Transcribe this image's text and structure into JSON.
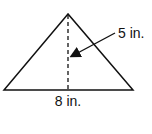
{
  "diagram": {
    "shape": "triangle",
    "height_label": "5 in.",
    "base_label": "8 in.",
    "colors": {
      "stroke": "#111111",
      "background": "#ffffff"
    }
  }
}
